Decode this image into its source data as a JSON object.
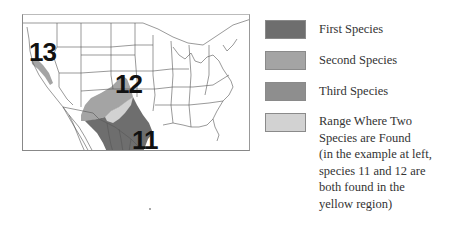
{
  "map": {
    "title": "Species range map of the United States",
    "labels": [
      {
        "id": "13",
        "text": "13"
      },
      {
        "id": "12",
        "text": "12"
      },
      {
        "id": "11",
        "text": "11"
      }
    ],
    "colors": {
      "first_species": "#6e6e6e",
      "second_species": "#a4a4a4",
      "third_species": "#8e8e8e",
      "overlap": "#d2d2d2",
      "state_lines": "#555555",
      "background": "#ffffff"
    }
  },
  "legend": {
    "items": [
      {
        "label": "First Species",
        "color": "#6e6e6e"
      },
      {
        "label": "Second Species",
        "color": "#a4a4a4"
      },
      {
        "label": "Third Species",
        "color": "#8e8e8e"
      },
      {
        "label": "Range Where Two\nSpecies are Found\n(in the example at left,\nspecies 11 and 12 are\nboth found in the\nyellow region)",
        "color": "#d2d2d2"
      }
    ]
  }
}
